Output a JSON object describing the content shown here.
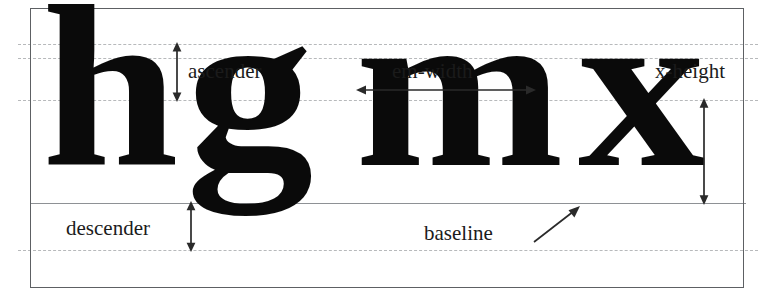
{
  "figure": {
    "background_color": "#ffffff",
    "frame_color": "#5d6063",
    "guide_color": "#b7b9bb",
    "baseline_color": "#8e9195",
    "text_color": "#1b1b1b",
    "glyph_color": "#0a0a0a"
  },
  "specimen": {
    "letters": [
      {
        "char": "h",
        "name": "letter-h"
      },
      {
        "char": "g",
        "name": "letter-g"
      },
      {
        "char": "m",
        "name": "letter-m"
      },
      {
        "char": "x",
        "name": "letter-x"
      }
    ],
    "sample_text": "hgmx"
  },
  "labels": {
    "ascender": "ascender",
    "em_width": "em-width",
    "x_height": "x-height",
    "descender": "descender",
    "baseline": "baseline"
  },
  "guides": [
    {
      "name": "cap-top-line",
      "y": 44,
      "style": "dashed"
    },
    {
      "name": "ascender-top-line",
      "y": 58,
      "style": "dashed"
    },
    {
      "name": "x-height-line",
      "y": 100,
      "style": "dashed"
    },
    {
      "name": "baseline-line",
      "y": 203,
      "style": "solid"
    },
    {
      "name": "descender-line",
      "y": 250,
      "style": "dashed"
    }
  ],
  "measures": [
    {
      "name": "ascender-measure",
      "orientation": "vertical",
      "from_y": 44,
      "to_y": 100,
      "x": 176
    },
    {
      "name": "em-width-measure",
      "orientation": "horizontal",
      "from_x": 358,
      "to_x": 532,
      "y": 89
    },
    {
      "name": "x-height-measure",
      "orientation": "vertical",
      "from_y": 100,
      "to_y": 203,
      "x": 703
    },
    {
      "name": "descender-measure",
      "orientation": "vertical",
      "from_y": 203,
      "to_y": 250,
      "x": 190
    },
    {
      "name": "baseline-pointer",
      "orientation": "diagonal",
      "from_x": 534,
      "from_y": 239,
      "to_x": 578,
      "to_y": 207
    }
  ]
}
